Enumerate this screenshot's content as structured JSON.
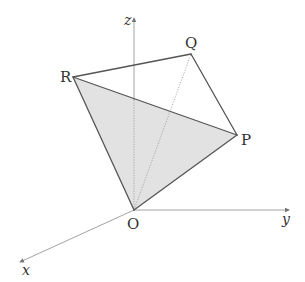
{
  "diagram": {
    "type": "3d-tetrahedron-on-axes",
    "colors": {
      "background": "#ffffff",
      "edge": "#555555",
      "axis": "#888888",
      "hidden": "#999999",
      "face_fill": "#e2e2e2"
    },
    "axes": {
      "x": {
        "label": "x",
        "from": [
          134,
          210
        ],
        "to": [
          20,
          262
        ],
        "label_pos": [
          22,
          275
        ]
      },
      "y": {
        "label": "y",
        "from": [
          134,
          210
        ],
        "to": [
          289,
          210
        ],
        "label_pos": [
          282,
          224
        ]
      },
      "z": {
        "label": "z",
        "from": [
          134,
          210
        ],
        "to": [
          134,
          18
        ],
        "label_pos": [
          124,
          25
        ]
      }
    },
    "points": [
      {
        "name": "O",
        "label": "O",
        "pos": [
          134,
          210
        ],
        "label_pos": [
          127,
          229
        ]
      },
      {
        "name": "P",
        "label": "P",
        "pos": [
          237,
          135
        ],
        "label_pos": [
          241,
          145
        ]
      },
      {
        "name": "Q",
        "label": "Q",
        "pos": [
          191,
          54
        ],
        "label_pos": [
          185,
          48
        ]
      },
      {
        "name": "R",
        "label": "R",
        "pos": [
          73,
          77
        ],
        "label_pos": [
          60,
          82
        ]
      }
    ],
    "shaded_face": [
      "O",
      "R",
      "P"
    ],
    "solid_edges": [
      [
        "R",
        "Q"
      ],
      [
        "Q",
        "P"
      ],
      [
        "R",
        "P"
      ],
      [
        "O",
        "R"
      ],
      [
        "O",
        "P"
      ]
    ],
    "dotted_edges": [
      [
        "O",
        "Q"
      ]
    ],
    "dotted_axis_segment": {
      "axis": "z",
      "from": [
        134,
        210
      ],
      "to": [
        134,
        101
      ]
    }
  }
}
